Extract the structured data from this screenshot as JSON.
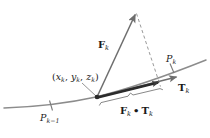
{
  "figure": {
    "type": "vector-diagram"
  },
  "labels": {
    "point_coords": {
      "open": "(",
      "x": "x",
      "xsub": "k",
      "comma1": ", ",
      "y": "y",
      "ysub": "k",
      "comma2": ", ",
      "z": "z",
      "zsub": "k",
      "close": ")"
    },
    "force_vector": {
      "symbol": "F",
      "sub": "k"
    },
    "tangent_vector": {
      "symbol": "T",
      "sub": "k"
    },
    "partition_point_right": {
      "symbol": "P",
      "sub": "k"
    },
    "partition_point_left": {
      "symbol": "P",
      "sub": "k−1"
    },
    "projection": {
      "first": "F",
      "first_sub": "k",
      "operator": "•",
      "second": "T",
      "second_sub": "k"
    }
  },
  "colors": {
    "curve": "#8c8c8c",
    "vector": "#6e6e6e",
    "projection_bar": "#2b2b2b",
    "dashed": "#9a9a9a",
    "tick": "#7a7a7a",
    "text": "#1a1a1a",
    "background": "#ffffff"
  },
  "geometry": {
    "curve_path": "M 4,108 C 34,107 64,104 96,97 C 128,89 166,76 206,60",
    "sample_point": [
      97,
      97
    ],
    "force_tip": [
      136,
      12
    ],
    "tangent_tip": [
      178,
      76
    ],
    "projection_end": [
      160,
      85
    ],
    "dashed_from": [
      136,
      12
    ],
    "dashed_to": [
      160,
      85
    ],
    "tick_left": [
      51,
      105
    ],
    "tick_right": [
      172,
      68
    ],
    "brace_from": [
      100,
      103
    ],
    "brace_to": [
      163,
      92
    ]
  }
}
